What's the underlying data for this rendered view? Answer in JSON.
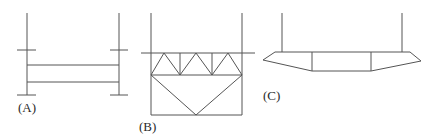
{
  "figure": {
    "panels": [
      {
        "label": "(A)",
        "description": "Two vertical posts with short crossbars, connected by two horizontal beams"
      },
      {
        "label": "(B)",
        "description": "Rectangular frame with Warren truss across top and V-shaped bracing below"
      },
      {
        "label": "(C)",
        "description": "Two vertical hangers supporting a tapered deck section divided into three panels"
      }
    ],
    "stroke_color": "#555555",
    "background": "#ffffff"
  }
}
